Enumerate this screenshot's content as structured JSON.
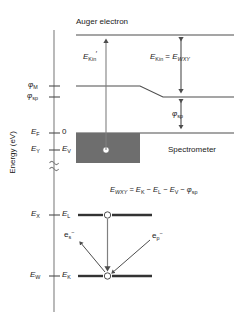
{
  "figure": {
    "title_top": "Auger electron",
    "spectrometer_label": "Spectrometer",
    "axis_label": "Energy (eV)"
  },
  "axis_ticks": [
    {
      "name": "phi-M",
      "left": "φ",
      "left_sub": "M",
      "right": "",
      "right_sub": ""
    },
    {
      "name": "phi-sp",
      "left": "φ",
      "left_sub": "sp",
      "right": "",
      "right_sub": ""
    },
    {
      "name": "E-F",
      "left": "E",
      "left_sub": "F",
      "right": "0",
      "right_sub": ""
    },
    {
      "name": "E-Y",
      "left": "E",
      "left_sub": "Y",
      "right": "E",
      "right_sub": "V"
    },
    {
      "name": "E-X",
      "left": "E",
      "left_sub": "X",
      "right": "E",
      "right_sub": "L"
    },
    {
      "name": "E-W",
      "left": "E",
      "left_sub": "W",
      "right": "E",
      "right_sub": "K"
    }
  ],
  "arrow_labels": {
    "kin_prime": {
      "base": "E",
      "sub": "Kin",
      "prime": "′"
    },
    "kin_equals_wxy": {
      "lhs_base": "E",
      "lhs_sub": "Kin",
      "eq": " = ",
      "rhs_base": "E",
      "rhs_sub": "WXY"
    },
    "phi_sp": {
      "base": "φ",
      "sub": "sp"
    }
  },
  "equation": {
    "lhs_base": "E",
    "lhs_sub": "WXY",
    "eq": " = ",
    "t1_base": "E",
    "t1_sub": "K",
    "op1": " − ",
    "t2_base": "E",
    "t2_sub": "L",
    "op2": " − ",
    "t3_base": "E",
    "t3_sub": "V",
    "op3": " − ",
    "t4_base": "φ",
    "t4_sub": "sp"
  },
  "electrons": [
    {
      "name": "e-s",
      "base": "e",
      "sub": "s",
      "sup": "−"
    },
    {
      "name": "e-p",
      "base": "e",
      "sub": "p",
      "sup": "−"
    }
  ],
  "colors": {
    "line": "#4d4d4d",
    "text": "#1a1a1a",
    "sample_fill": "#6e6e6e",
    "hole_fill": "#ffffff",
    "level_line": "#333333"
  }
}
